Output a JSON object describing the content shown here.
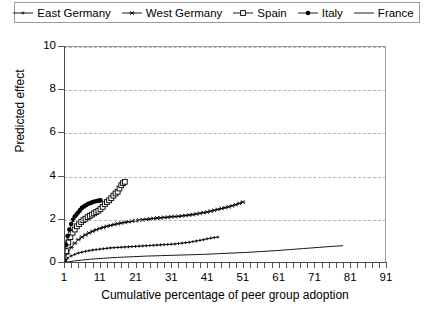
{
  "chart_data": {
    "type": "line",
    "title": "",
    "xlabel": "Cumulative percentage of peer group adoption",
    "ylabel": "Predicted effect",
    "xlim": [
      1,
      91
    ],
    "ylim": [
      0,
      10
    ],
    "xticks": [
      1,
      11,
      21,
      31,
      41,
      51,
      61,
      71,
      81,
      91
    ],
    "yticks": [
      0,
      2,
      4,
      6,
      8,
      10
    ],
    "xtick_minor_step": 2,
    "grid": "horizontal-dashed",
    "legend_position": "top",
    "series": [
      {
        "name": "East Germany",
        "marker": "tiny-line-dot",
        "color": "#000000",
        "x": [
          1,
          2,
          3,
          4,
          5,
          6,
          7,
          8,
          9,
          10,
          11,
          12,
          13,
          14,
          15,
          16,
          17,
          18,
          19,
          20,
          21,
          22,
          23,
          24,
          25,
          26,
          27,
          28,
          29,
          30,
          31,
          32,
          33,
          34,
          35,
          36,
          37,
          38,
          39,
          40,
          41,
          42,
          43,
          44
        ],
        "y": [
          0.05,
          0.22,
          0.33,
          0.4,
          0.46,
          0.5,
          0.54,
          0.57,
          0.6,
          0.62,
          0.64,
          0.66,
          0.68,
          0.7,
          0.71,
          0.72,
          0.73,
          0.74,
          0.75,
          0.76,
          0.77,
          0.78,
          0.79,
          0.8,
          0.81,
          0.82,
          0.83,
          0.84,
          0.85,
          0.86,
          0.87,
          0.88,
          0.9,
          0.92,
          0.94,
          0.96,
          0.99,
          1.02,
          1.05,
          1.08,
          1.12,
          1.15,
          1.18,
          1.2
        ]
      },
      {
        "name": "West Germany",
        "marker": "asterisk",
        "color": "#000000",
        "x": [
          1,
          2,
          3,
          4,
          5,
          6,
          7,
          8,
          9,
          10,
          11,
          12,
          13,
          14,
          15,
          16,
          17,
          18,
          19,
          20,
          21,
          22,
          23,
          24,
          25,
          26,
          27,
          28,
          29,
          30,
          31,
          32,
          33,
          34,
          35,
          36,
          37,
          38,
          39,
          40,
          41,
          42,
          43,
          44,
          45,
          46,
          47,
          48,
          49,
          50,
          51
        ],
        "y": [
          0.05,
          0.45,
          0.72,
          0.92,
          1.08,
          1.2,
          1.3,
          1.39,
          1.47,
          1.54,
          1.6,
          1.65,
          1.7,
          1.74,
          1.78,
          1.82,
          1.85,
          1.88,
          1.91,
          1.94,
          1.96,
          1.98,
          2.0,
          2.02,
          2.04,
          2.06,
          2.08,
          2.09,
          2.11,
          2.12,
          2.14,
          2.15,
          2.16,
          2.18,
          2.2,
          2.22,
          2.24,
          2.27,
          2.3,
          2.33,
          2.36,
          2.4,
          2.44,
          2.48,
          2.52,
          2.56,
          2.6,
          2.65,
          2.7,
          2.76,
          2.82
        ]
      },
      {
        "name": "Spain",
        "marker": "open-square",
        "color": "#000000",
        "x": [
          1,
          1.6,
          2.2,
          2.8,
          3.4,
          4,
          4.6,
          5.2,
          5.8,
          6.4,
          7,
          7.6,
          8.2,
          8.8,
          9.4,
          10,
          10.6,
          11.2,
          11.8,
          12.4,
          13,
          13.6,
          14.2,
          14.8,
          15.4,
          16,
          16.5,
          17,
          17.5,
          18
        ],
        "y": [
          0.05,
          0.55,
          0.95,
          1.2,
          1.4,
          1.55,
          1.7,
          1.8,
          1.9,
          1.98,
          2.05,
          2.12,
          2.18,
          2.24,
          2.3,
          2.36,
          2.42,
          2.5,
          2.6,
          2.72,
          2.82,
          2.9,
          3.0,
          3.12,
          3.22,
          3.3,
          3.45,
          3.6,
          3.7,
          3.76
        ]
      },
      {
        "name": "Italy",
        "marker": "filled-circle",
        "color": "#000000",
        "x": [
          1,
          1.5,
          2,
          2.5,
          3,
          3.5,
          4,
          4.5,
          5,
          5.5,
          6,
          6.6,
          7.2,
          7.8,
          8.4,
          9,
          9.6,
          10.2,
          10.8,
          11.2
        ],
        "y": [
          0.05,
          0.85,
          1.25,
          1.55,
          1.8,
          2.0,
          2.15,
          2.25,
          2.35,
          2.45,
          2.55,
          2.62,
          2.68,
          2.74,
          2.78,
          2.82,
          2.85,
          2.87,
          2.89,
          2.9
        ]
      },
      {
        "name": "France",
        "marker": "none",
        "color": "#000000",
        "x": [
          1,
          4,
          8,
          12,
          16,
          20,
          24,
          28,
          32,
          36,
          40,
          44,
          48,
          52,
          56,
          60,
          64,
          68,
          72,
          76,
          79
        ],
        "y": [
          0.02,
          0.1,
          0.17,
          0.22,
          0.26,
          0.29,
          0.32,
          0.34,
          0.36,
          0.38,
          0.4,
          0.43,
          0.46,
          0.49,
          0.53,
          0.57,
          0.62,
          0.67,
          0.72,
          0.77,
          0.8
        ]
      }
    ]
  },
  "legend": {
    "items": [
      {
        "label": "East Germany",
        "marker": "tiny-line-dot"
      },
      {
        "label": "West Germany",
        "marker": "asterisk"
      },
      {
        "label": "Spain",
        "marker": "open-square"
      },
      {
        "label": "Italy",
        "marker": "filled-circle"
      },
      {
        "label": "France",
        "marker": "none"
      }
    ]
  },
  "axes": {
    "x_title": "Cumulative percentage of peer group adoption",
    "y_title": "Predicted effect",
    "x_tick_labels": [
      "1",
      "11",
      "21",
      "31",
      "41",
      "51",
      "61",
      "71",
      "81",
      "91"
    ],
    "y_tick_labels": [
      "0",
      "2",
      "4",
      "6",
      "8",
      "10"
    ]
  },
  "colors": {
    "ink": "#000000",
    "grid": "#b5b5b5",
    "frame": "#9f9f9f",
    "legend_border": "#9a9a9a"
  }
}
